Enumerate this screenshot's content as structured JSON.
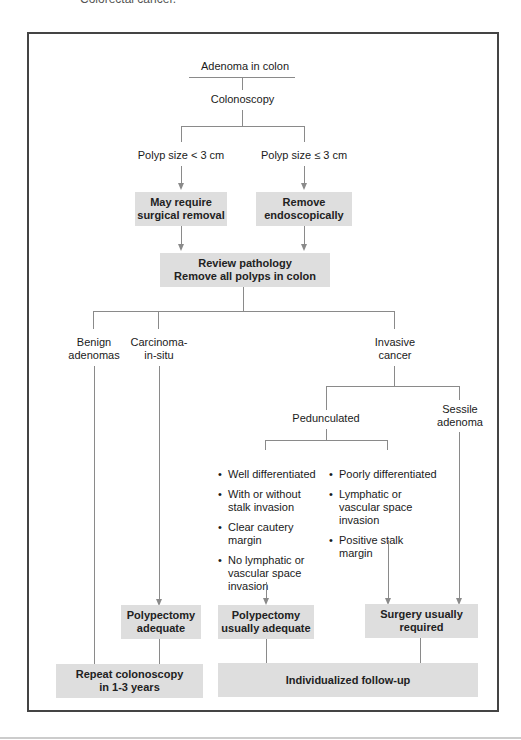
{
  "caption": "Colorectal cancer.",
  "nodes": {
    "start": "Adenoma in colon",
    "colonoscopy": "Colonoscopy",
    "polyp_small": "Polyp size < 3 cm",
    "polyp_large": "Polyp size ≤ 3 cm",
    "surgical": [
      "May require",
      "surgical removal"
    ],
    "endoscopic": [
      "Remove",
      "endoscopically"
    ],
    "review": [
      "Review pathology",
      "Remove all polyps in colon"
    ],
    "benign": [
      "Benign",
      "adenomas"
    ],
    "cis": [
      "Carcinoma-",
      "in-situ"
    ],
    "invasive": [
      "Invasive",
      "cancer"
    ],
    "pedunculated": "Pedunculated",
    "sessile": [
      "Sessile",
      "adenoma"
    ],
    "favorable": [
      "Well differentiated",
      "With or without stalk invasion",
      "Clear cautery margin",
      "No lymphatic or vascular space invasion"
    ],
    "unfavorable": [
      "Poorly differentiated",
      "Lymphatic or vascular space invasion",
      "Positive stalk margin"
    ],
    "polypectomy_adequate": [
      "Polypectomy",
      "adequate"
    ],
    "polypectomy_usually": [
      "Polypectomy",
      "usually adequate"
    ],
    "surgery_required": [
      "Surgery usually",
      "required"
    ],
    "repeat": [
      "Repeat colonoscopy",
      "in 1-3 years"
    ],
    "followup": "Individualized follow-up"
  },
  "colors": {
    "box_fill": "#dedede",
    "line": "#8a8a8a",
    "frame": "#444444"
  }
}
